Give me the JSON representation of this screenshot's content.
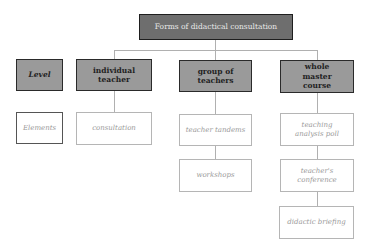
{
  "diagram": {
    "title": "Forms of didactical consultation",
    "levels_header": {
      "label": "Level",
      "elements_label": "Elements"
    },
    "columns": [
      {
        "label": "individual teacher",
        "items": [
          "consultation"
        ]
      },
      {
        "label": "group of teachers",
        "items": [
          "teacher tandems",
          "workshops"
        ]
      },
      {
        "label": "whole master course",
        "items": [
          "teaching analysis poll",
          "teacher's conference",
          "didactic briefing"
        ]
      }
    ],
    "colors": {
      "root_fill": "#6e6e6e",
      "header_fill": "#9a9a9a",
      "leaf_fill": "#ffffff",
      "connector": "#b0b0b0"
    }
  }
}
